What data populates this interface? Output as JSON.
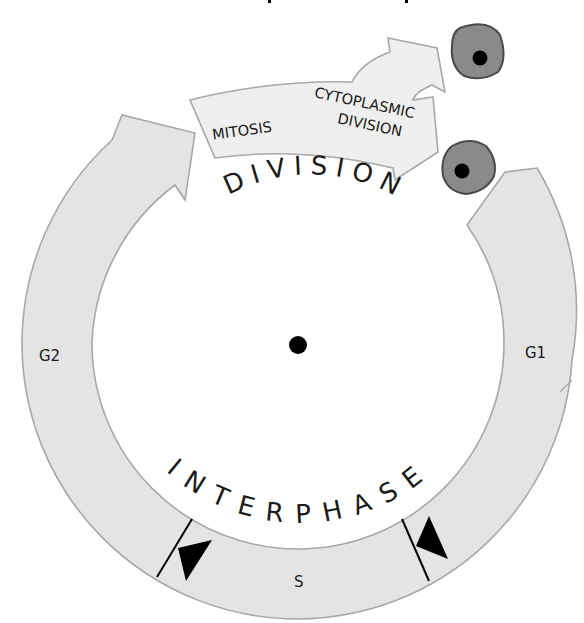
{
  "diagram": {
    "type": "cell-cycle",
    "center_label": "",
    "phases": {
      "g1": "G1",
      "s": "S",
      "g2": "G2"
    },
    "division": {
      "heading": "DIVISION",
      "mitosis": "MITOSIS",
      "cytoplasmic_line1": "CYTOPLASMIC",
      "cytoplasmic_line2": "DIVISION"
    },
    "interphase": {
      "heading": "INTERPHASE"
    },
    "colors": {
      "ring_fill": "#e4e4e4",
      "ring_stroke": "#a8a8a8",
      "cell_fill": "#8a8a8a",
      "nucleus": "#000000"
    }
  }
}
